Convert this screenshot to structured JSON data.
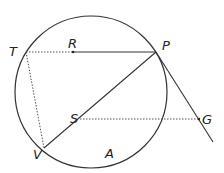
{
  "diagram": {
    "type": "circle-geometry",
    "circle": {
      "cx": 91,
      "cy": 92,
      "r": 76,
      "color": "#333333"
    },
    "points": {
      "T": {
        "x": 26,
        "y": 52,
        "label": "T",
        "lx": 9,
        "ly": 52
      },
      "R": {
        "x": 73,
        "y": 52,
        "label": "R",
        "lx": 68,
        "ly": 46
      },
      "P": {
        "x": 156,
        "y": 52,
        "label": "P",
        "lx": 163,
        "ly": 47
      },
      "S": {
        "x": 80,
        "y": 119,
        "label": "S",
        "lx": 71,
        "ly": 119
      },
      "G": {
        "x": 199,
        "y": 119,
        "label": "G",
        "lx": 203,
        "ly": 120
      },
      "V": {
        "x": 44,
        "y": 148,
        "label": "V",
        "lx": 33,
        "ly": 158
      },
      "A": {
        "label": "A",
        "lx": 105,
        "ly": 158
      }
    },
    "segments": [
      {
        "name": "TR",
        "style": "dotted"
      },
      {
        "name": "RP",
        "style": "solid"
      },
      {
        "name": "TV",
        "style": "dotted"
      },
      {
        "name": "VP",
        "style": "solid"
      },
      {
        "name": "SG",
        "style": "dotted"
      },
      {
        "name": "tangent-at-P",
        "style": "solid"
      }
    ]
  }
}
